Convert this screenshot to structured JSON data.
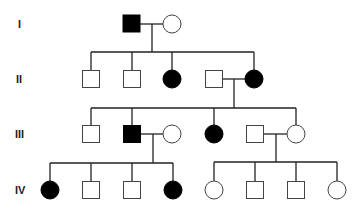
{
  "diagram": {
    "type": "pedigree",
    "generations": [
      {
        "label": "I",
        "y": 24
      },
      {
        "label": "II",
        "y": 79
      },
      {
        "label": "III",
        "y": 134
      },
      {
        "label": "IV",
        "y": 190
      }
    ],
    "individuals": [
      {
        "id": "I-1",
        "gen": "I",
        "sex": "male",
        "affected": true,
        "x": 132,
        "y": 24
      },
      {
        "id": "I-2",
        "gen": "I",
        "sex": "female",
        "affected": false,
        "x": 172,
        "y": 24
      },
      {
        "id": "II-1",
        "gen": "II",
        "sex": "male",
        "affected": false,
        "x": 91,
        "y": 79
      },
      {
        "id": "II-2",
        "gen": "II",
        "sex": "male",
        "affected": false,
        "x": 132,
        "y": 79
      },
      {
        "id": "II-3",
        "gen": "II",
        "sex": "female",
        "affected": true,
        "x": 172,
        "y": 79
      },
      {
        "id": "II-4",
        "gen": "II",
        "sex": "male",
        "affected": false,
        "x": 214,
        "y": 79
      },
      {
        "id": "II-5",
        "gen": "II",
        "sex": "female",
        "affected": true,
        "x": 254,
        "y": 79
      },
      {
        "id": "III-1",
        "gen": "III",
        "sex": "male",
        "affected": false,
        "x": 91,
        "y": 134
      },
      {
        "id": "III-2",
        "gen": "III",
        "sex": "male",
        "affected": true,
        "x": 132,
        "y": 134
      },
      {
        "id": "III-3",
        "gen": "III",
        "sex": "female",
        "affected": false,
        "x": 172,
        "y": 134
      },
      {
        "id": "III-4",
        "gen": "III",
        "sex": "female",
        "affected": true,
        "x": 214,
        "y": 134
      },
      {
        "id": "III-5",
        "gen": "III",
        "sex": "male",
        "affected": false,
        "x": 255,
        "y": 134
      },
      {
        "id": "III-6",
        "gen": "III",
        "sex": "female",
        "affected": false,
        "x": 296,
        "y": 134
      },
      {
        "id": "IV-1",
        "gen": "IV",
        "sex": "female",
        "affected": true,
        "x": 50,
        "y": 190
      },
      {
        "id": "IV-2",
        "gen": "IV",
        "sex": "male",
        "affected": false,
        "x": 91,
        "y": 190
      },
      {
        "id": "IV-3",
        "gen": "IV",
        "sex": "male",
        "affected": false,
        "x": 132,
        "y": 190
      },
      {
        "id": "IV-4",
        "gen": "IV",
        "sex": "female",
        "affected": true,
        "x": 173,
        "y": 190
      },
      {
        "id": "IV-5",
        "gen": "IV",
        "sex": "female",
        "affected": false,
        "x": 214,
        "y": 190
      },
      {
        "id": "IV-6",
        "gen": "IV",
        "sex": "male",
        "affected": false,
        "x": 255,
        "y": 190
      },
      {
        "id": "IV-7",
        "gen": "IV",
        "sex": "male",
        "affected": false,
        "x": 296,
        "y": 190
      },
      {
        "id": "IV-8",
        "gen": "IV",
        "sex": "female",
        "affected": false,
        "x": 337,
        "y": 190
      }
    ],
    "unions": [
      {
        "partners": [
          "I-1",
          "I-2"
        ],
        "children": [
          "II-1",
          "II-2",
          "II-3",
          "II-5"
        ]
      },
      {
        "partners": [
          "II-4",
          "II-5"
        ],
        "children": [
          "III-1",
          "III-2",
          "III-4",
          "III-6"
        ]
      },
      {
        "partners": [
          "III-2",
          "III-3"
        ],
        "children": [
          "IV-1",
          "IV-2",
          "IV-3",
          "IV-4"
        ]
      },
      {
        "partners": [
          "III-5",
          "III-6"
        ],
        "children": [
          "IV-5",
          "IV-6",
          "IV-7",
          "IV-8"
        ]
      }
    ],
    "legend": {
      "filled": "affected",
      "open": "unaffected",
      "square": "male",
      "circle": "female"
    }
  }
}
